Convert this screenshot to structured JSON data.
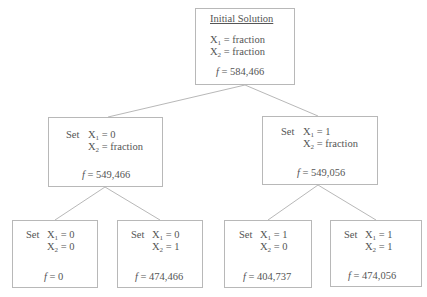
{
  "diagram": {
    "type": "branch-and-bound-tree",
    "root": {
      "title": "Initial Solution",
      "x1": "X",
      "x1_sub": "1",
      "x1_val": "= fraction",
      "x2": "X",
      "x2_sub": "2",
      "x2_val": "= fraction",
      "f_label": "f",
      "f_val": "= 584,466"
    },
    "nodes": [
      {
        "id": "n1",
        "set": "Set",
        "x1": "X",
        "x1_sub": "1",
        "x1_val": "= 0",
        "x2": "X",
        "x2_sub": "2",
        "x2_val": "= fraction",
        "f_label": "f",
        "f_val": "= 549,466"
      },
      {
        "id": "n2",
        "set": "Set",
        "x1": "X",
        "x1_sub": "1",
        "x1_val": "= 1",
        "x2": "X",
        "x2_sub": "2",
        "x2_val": "= fraction",
        "f_label": "f",
        "f_val": "= 549,056"
      },
      {
        "id": "n3",
        "set": "Set",
        "x1": "X",
        "x1_sub": "1",
        "x1_val": "= 0",
        "x2": "X",
        "x2_sub": "2",
        "x2_val": "= 0",
        "f_label": "f",
        "f_val": "= 0"
      },
      {
        "id": "n4",
        "set": "Set",
        "x1": "X",
        "x1_sub": "1",
        "x1_val": "= 0",
        "x2": "X",
        "x2_sub": "2",
        "x2_val": "= 1",
        "f_label": "f",
        "f_val": "= 474,466"
      },
      {
        "id": "n5",
        "set": "Set",
        "x1": "X",
        "x1_sub": "1",
        "x1_val": "= 1",
        "x2": "X",
        "x2_sub": "2",
        "x2_val": "= 0",
        "f_label": "f",
        "f_val": "= 404,737"
      },
      {
        "id": "n6",
        "set": "Set",
        "x1": "X",
        "x1_sub": "1",
        "x1_val": "= 1",
        "x2": "X",
        "x2_sub": "2",
        "x2_val": "= 1",
        "f_label": "f",
        "f_val": "= 474,056"
      }
    ],
    "edges": [
      [
        "root",
        "n1"
      ],
      [
        "root",
        "n2"
      ],
      [
        "n1",
        "n3"
      ],
      [
        "n1",
        "n4"
      ],
      [
        "n2",
        "n5"
      ],
      [
        "n2",
        "n6"
      ]
    ]
  }
}
